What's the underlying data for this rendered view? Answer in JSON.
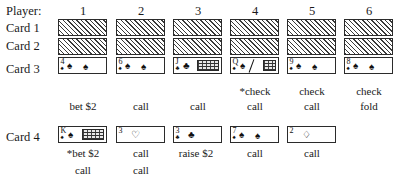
{
  "labels": {
    "player_header": "Player:",
    "card1": "Card 1",
    "card2": "Card 2",
    "card3": "Card 3",
    "card4": "Card 4"
  },
  "players": [
    {
      "number": "1"
    },
    {
      "number": "2"
    },
    {
      "number": "3"
    },
    {
      "number": "4"
    },
    {
      "number": "5"
    },
    {
      "number": "6"
    }
  ],
  "cards": {
    "card3": [
      {
        "rank": "4",
        "suit": "♠",
        "facedown": false,
        "face_card": false
      },
      {
        "rank": "6",
        "suit": "♠",
        "facedown": false,
        "face_card": false
      },
      {
        "rank": "J",
        "suit": "♣",
        "facedown": false,
        "face_card": true
      },
      {
        "rank": "Q",
        "suit": "♠",
        "facedown": false,
        "face_card": true
      },
      {
        "rank": "9",
        "suit": "♠",
        "facedown": false,
        "face_card": false
      },
      {
        "rank": "8",
        "suit": "♠",
        "facedown": false,
        "face_card": false
      }
    ],
    "card4": [
      {
        "rank": "K",
        "suit": "♠",
        "facedown": false,
        "face_card": true
      },
      {
        "rank": "3",
        "suit": "♡",
        "facedown": false,
        "face_card": false
      },
      {
        "rank": "3",
        "suit": "♣",
        "facedown": false,
        "face_card": false
      },
      {
        "rank": "7",
        "suit": "♠",
        "facedown": false,
        "face_card": false
      },
      {
        "rank": "2",
        "suit": "♢",
        "facedown": false,
        "face_card": false
      }
    ]
  },
  "betting": {
    "third_street": {
      "line1": [
        "",
        "",
        "",
        "*check",
        "check",
        "check"
      ],
      "line2": [
        "bet $2",
        "call",
        "call",
        "call",
        "call",
        "fold"
      ]
    },
    "fourth_street": {
      "line1": [
        "*bet $2",
        "call",
        "raise $2",
        "call",
        "call",
        ""
      ],
      "line2": [
        "call",
        "call",
        "",
        "",
        "",
        ""
      ]
    }
  }
}
